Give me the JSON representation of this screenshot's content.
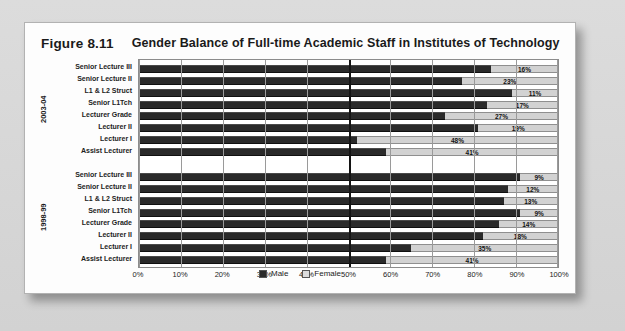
{
  "figure": {
    "number": "Figure 8.11",
    "title": "Gender Balance of Full-time Academic Staff in Institutes of Technology"
  },
  "chart_data": {
    "type": "bar",
    "orientation": "horizontal",
    "stacked": true,
    "percent": true,
    "title": "Gender Balance of Full-time Academic Staff in Institutes of Technology",
    "xlabel": "",
    "ylabel": "",
    "xlim": [
      0,
      100
    ],
    "xticks": [
      "0%",
      "10%",
      "20%",
      "30%",
      "40%",
      "50%",
      "60%",
      "70%",
      "80%",
      "90%",
      "100%"
    ],
    "grid": true,
    "midline_at": 50,
    "legend_position": "bottom",
    "legend": [
      "Male",
      "Female"
    ],
    "series_colors": {
      "male": "#2a2a2a",
      "female": "#d2d2d2"
    },
    "groups": [
      {
        "name": "2003-04",
        "categories": [
          "Senior Lecture III",
          "Senior Lecture II",
          "L1 & L2 Struct",
          "Senior L1Tch",
          "Lecturer Grade",
          "Lecturer II",
          "Lecturer I",
          "Assist Lecturer"
        ],
        "female_values": [
          16,
          23,
          11,
          17,
          27,
          19,
          48,
          41
        ],
        "male_values": [
          84,
          77,
          89,
          83,
          73,
          81,
          52,
          59
        ],
        "labels": [
          "16%",
          "23%",
          "11%",
          "17%",
          "27%",
          "19%",
          "48%",
          "41%"
        ]
      },
      {
        "name": "1998-99",
        "categories": [
          "Senior Lecture III",
          "Senior Lecture II",
          "L1 & L2 Struct",
          "Senior L1Tch",
          "Lecturer Grade",
          "Lecturer II",
          "Lecturer I",
          "Assist Lecturer"
        ],
        "female_values": [
          9,
          12,
          13,
          9,
          14,
          18,
          35,
          41
        ],
        "male_values": [
          91,
          88,
          87,
          91,
          86,
          82,
          65,
          59
        ],
        "labels": [
          "9%",
          "12%",
          "13%",
          "9%",
          "14%",
          "18%",
          "35%",
          "41%"
        ]
      }
    ]
  }
}
